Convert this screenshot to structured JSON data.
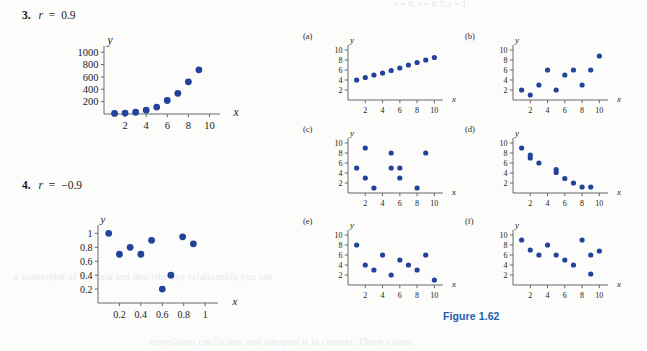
{
  "page": {
    "background_color": "#fcfcfb",
    "point_color": "#22429b",
    "axis_color": "#595959",
    "caption_color": "#1d5fae"
  },
  "showthrough": {
    "top": "r = 0,   r = 0.7,   r = 1.",
    "middle": "a scatterplot of the data and describe any relationship you see",
    "bottom": "correlation coefficient and interpret it in context. These values"
  },
  "problems": [
    {
      "number": "3.",
      "statement": "r = 0.9",
      "r_symbol": "r",
      "r_value": "0.9",
      "sign": "="
    },
    {
      "number": "4.",
      "statement": "r = −0.9",
      "r_symbol": "r",
      "r_value": "−0.9",
      "sign": "="
    }
  ],
  "figure": {
    "caption": "Figure 1.62"
  },
  "chart_data": [
    {
      "id": "problem-3",
      "type": "scatter",
      "title": "3. r = 0.9",
      "xlabel": "x",
      "ylabel": "y",
      "xlim": [
        0,
        11
      ],
      "ylim": [
        0,
        1100
      ],
      "xticks": [
        2,
        4,
        6,
        8,
        10
      ],
      "yticks": [
        200,
        400,
        600,
        800,
        1000
      ],
      "xticklabels": [
        "2",
        "4",
        "6",
        "8",
        "10"
      ],
      "yticklabels": [
        "200",
        "400",
        "600",
        "800",
        "1000"
      ],
      "grid": false,
      "legend": null,
      "points": [
        [
          1,
          10
        ],
        [
          2,
          15
        ],
        [
          3,
          28
        ],
        [
          4,
          62
        ],
        [
          5,
          112
        ],
        [
          6,
          218
        ],
        [
          7,
          335
        ],
        [
          8,
          520
        ],
        [
          9,
          715
        ]
      ]
    },
    {
      "id": "problem-4",
      "type": "scatter",
      "title": "4. r = −0.9",
      "xlabel": "x",
      "ylabel": "y",
      "xlim": [
        0,
        1.12
      ],
      "ylim": [
        0,
        1.12
      ],
      "xticks": [
        0.2,
        0.4,
        0.6,
        0.8,
        1
      ],
      "yticks": [
        0.2,
        0.4,
        0.6,
        0.8,
        1
      ],
      "xticklabels": [
        "0.2",
        "0.4",
        "0.6",
        "0.8",
        "1"
      ],
      "yticklabels": [
        "0.2",
        "0.4",
        "0.6",
        "0.8",
        "1"
      ],
      "grid": false,
      "legend": null,
      "points": [
        [
          0.1,
          1.0
        ],
        [
          0.2,
          0.7
        ],
        [
          0.3,
          0.8
        ],
        [
          0.4,
          0.7
        ],
        [
          0.5,
          0.9
        ],
        [
          0.6,
          0.2
        ],
        [
          0.68,
          0.4
        ],
        [
          0.79,
          0.95
        ],
        [
          0.89,
          0.85
        ]
      ]
    },
    {
      "id": "panel-a",
      "type": "scatter",
      "title": "(a)",
      "xlabel": "x",
      "ylabel": "y",
      "xlim": [
        0,
        11
      ],
      "ylim": [
        0,
        11
      ],
      "xticks": [
        2,
        4,
        6,
        8,
        10
      ],
      "yticks": [
        2,
        4,
        6,
        8,
        10
      ],
      "xticklabels": [
        "2",
        "4",
        "6",
        "8",
        "10"
      ],
      "yticklabels": [
        "2",
        "4",
        "6",
        "8",
        "10"
      ],
      "grid": false,
      "legend": null,
      "points": [
        [
          1,
          4.0
        ],
        [
          2,
          4.5
        ],
        [
          3,
          5.0
        ],
        [
          4,
          5.4
        ],
        [
          5,
          5.9
        ],
        [
          6,
          6.4
        ],
        [
          7,
          7.0
        ],
        [
          8,
          7.5
        ],
        [
          9,
          8.0
        ],
        [
          10,
          8.5
        ]
      ]
    },
    {
      "id": "panel-b",
      "type": "scatter",
      "title": "(b)",
      "xlabel": "x",
      "ylabel": "y",
      "xlim": [
        0,
        11
      ],
      "ylim": [
        0,
        11
      ],
      "xticks": [
        2,
        4,
        6,
        8,
        10
      ],
      "yticks": [
        2,
        4,
        6,
        8,
        10
      ],
      "xticklabels": [
        "2",
        "4",
        "6",
        "8",
        "10"
      ],
      "yticklabels": [
        "2",
        "4",
        "6",
        "8",
        "10"
      ],
      "grid": false,
      "legend": null,
      "points": [
        [
          1,
          2
        ],
        [
          2,
          1
        ],
        [
          3,
          3
        ],
        [
          4,
          6
        ],
        [
          5,
          2
        ],
        [
          6,
          5
        ],
        [
          7,
          6
        ],
        [
          8,
          3
        ],
        [
          9,
          6
        ],
        [
          10,
          8.8
        ]
      ]
    },
    {
      "id": "panel-c",
      "type": "scatter",
      "title": "(c)",
      "xlabel": "x",
      "ylabel": "y",
      "xlim": [
        0,
        11
      ],
      "ylim": [
        0,
        11
      ],
      "xticks": [
        2,
        4,
        6,
        8,
        10
      ],
      "yticks": [
        2,
        4,
        6,
        8,
        10
      ],
      "xticklabels": [
        "2",
        "4",
        "6",
        "8",
        "10"
      ],
      "yticklabels": [
        "2",
        "4",
        "6",
        "8",
        "10"
      ],
      "grid": false,
      "legend": null,
      "points": [
        [
          1,
          5
        ],
        [
          2,
          9
        ],
        [
          2,
          3
        ],
        [
          3,
          1
        ],
        [
          5,
          8
        ],
        [
          5,
          5
        ],
        [
          6,
          5
        ],
        [
          6,
          3
        ],
        [
          8,
          1
        ],
        [
          9,
          8
        ]
      ]
    },
    {
      "id": "panel-d",
      "type": "scatter",
      "title": "(d)",
      "xlabel": "x",
      "ylabel": "y",
      "xlim": [
        0,
        11
      ],
      "ylim": [
        0,
        11
      ],
      "xticks": [
        2,
        4,
        6,
        8,
        10
      ],
      "yticks": [
        2,
        4,
        6,
        8,
        10
      ],
      "xticklabels": [
        "2",
        "4",
        "6",
        "8",
        "10"
      ],
      "yticklabels": [
        "2",
        "4",
        "6",
        "8",
        "10"
      ],
      "grid": false,
      "legend": null,
      "points": [
        [
          1,
          9
        ],
        [
          2,
          7.6
        ],
        [
          2,
          7.0
        ],
        [
          3,
          6
        ],
        [
          5,
          4.7
        ],
        [
          5,
          4.1
        ],
        [
          6,
          2.9
        ],
        [
          7,
          2
        ],
        [
          8,
          1.2
        ],
        [
          9,
          1.2
        ]
      ]
    },
    {
      "id": "panel-e",
      "type": "scatter",
      "title": "(e)",
      "xlabel": "x",
      "ylabel": "y",
      "xlim": [
        0,
        11
      ],
      "ylim": [
        0,
        11
      ],
      "xticks": [
        2,
        4,
        6,
        8,
        10
      ],
      "yticks": [
        2,
        4,
        6,
        8,
        10
      ],
      "xticklabels": [
        "2",
        "4",
        "6",
        "8",
        "10"
      ],
      "yticklabels": [
        "2",
        "4",
        "6",
        "8",
        "10"
      ],
      "grid": false,
      "legend": null,
      "points": [
        [
          1,
          8
        ],
        [
          2,
          4
        ],
        [
          3,
          3
        ],
        [
          4,
          6
        ],
        [
          5,
          2
        ],
        [
          6,
          5
        ],
        [
          7,
          4
        ],
        [
          8,
          3
        ],
        [
          9,
          6
        ],
        [
          10,
          1
        ]
      ]
    },
    {
      "id": "panel-f",
      "type": "scatter",
      "title": "(f)",
      "xlabel": "x",
      "ylabel": "y",
      "xlim": [
        0,
        11
      ],
      "ylim": [
        0,
        11
      ],
      "xticks": [
        2,
        4,
        6,
        8,
        10
      ],
      "yticks": [
        2,
        4,
        6,
        8,
        10
      ],
      "xticklabels": [
        "2",
        "4",
        "6",
        "8",
        "10"
      ],
      "yticklabels": [
        "2",
        "4",
        "6",
        "8",
        "10"
      ],
      "grid": false,
      "legend": null,
      "points": [
        [
          1,
          9
        ],
        [
          2,
          7
        ],
        [
          3,
          6
        ],
        [
          4,
          8
        ],
        [
          5,
          6
        ],
        [
          6,
          5
        ],
        [
          7,
          4
        ],
        [
          8,
          9
        ],
        [
          9,
          6
        ],
        [
          9,
          2.2
        ],
        [
          10,
          6.8
        ]
      ]
    }
  ]
}
